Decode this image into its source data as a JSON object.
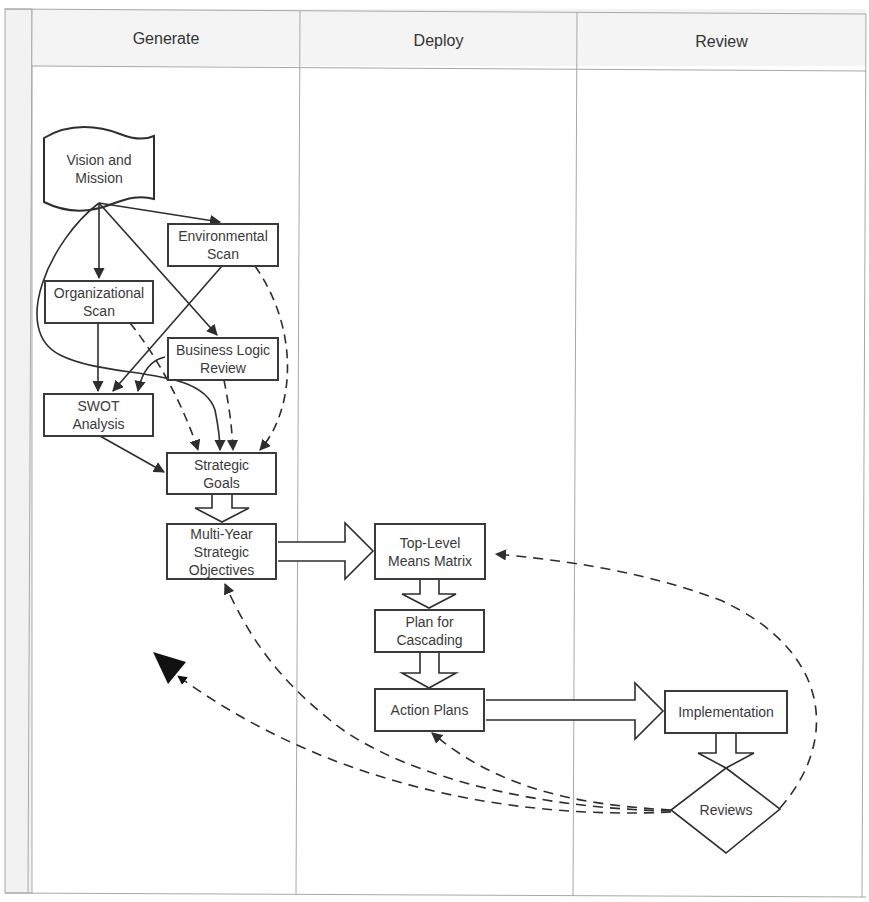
{
  "diagram": {
    "type": "swimlane-flowchart",
    "lanes": [
      {
        "id": "generate",
        "label": "Generate"
      },
      {
        "id": "deploy",
        "label": "Deploy"
      },
      {
        "id": "review",
        "label": "Review"
      }
    ],
    "nodes": {
      "vision": {
        "label": "Vision and\nMission",
        "shape": "document",
        "lane": "generate"
      },
      "env_scan": {
        "label": "Environmental\nScan",
        "shape": "rectangle",
        "lane": "generate"
      },
      "org_scan": {
        "label": "Organizational\nScan",
        "shape": "rectangle",
        "lane": "generate"
      },
      "blr": {
        "label": "Business Logic\nReview",
        "shape": "rectangle",
        "lane": "generate"
      },
      "swot": {
        "label": "SWOT\nAnalysis",
        "shape": "rectangle",
        "lane": "generate"
      },
      "goals": {
        "label": "Strategic\nGoals",
        "shape": "rectangle",
        "lane": "generate"
      },
      "multiyear": {
        "label": "Multi-Year\nStrategic\nObjectives",
        "shape": "rectangle",
        "lane": "generate"
      },
      "toplevel": {
        "label": "Top-Level\nMeans Matrix",
        "shape": "rectangle",
        "lane": "deploy"
      },
      "cascading": {
        "label": "Plan for\nCascading",
        "shape": "rectangle",
        "lane": "deploy"
      },
      "action": {
        "label": "Action Plans",
        "shape": "rectangle",
        "lane": "deploy"
      },
      "impl": {
        "label": "Implementation",
        "shape": "rectangle",
        "lane": "review"
      },
      "reviews": {
        "label": "Reviews",
        "shape": "diamond",
        "lane": "review"
      }
    },
    "edges": [
      {
        "from": "vision",
        "to": "org_scan",
        "style": "solid"
      },
      {
        "from": "vision",
        "to": "env_scan",
        "style": "solid"
      },
      {
        "from": "vision",
        "to": "blr",
        "style": "solid"
      },
      {
        "from": "vision",
        "to": "goals",
        "style": "solid-curved"
      },
      {
        "from": "org_scan",
        "to": "swot",
        "style": "solid"
      },
      {
        "from": "env_scan",
        "to": "swot",
        "style": "solid"
      },
      {
        "from": "blr",
        "to": "swot",
        "style": "solid-curved"
      },
      {
        "from": "swot",
        "to": "goals",
        "style": "solid"
      },
      {
        "from": "org_scan",
        "to": "goals",
        "style": "dashed"
      },
      {
        "from": "blr",
        "to": "goals",
        "style": "dashed"
      },
      {
        "from": "env_scan",
        "to": "goals",
        "style": "dashed"
      },
      {
        "from": "goals",
        "to": "multiyear",
        "style": "block-arrow"
      },
      {
        "from": "multiyear",
        "to": "toplevel",
        "style": "block-arrow"
      },
      {
        "from": "toplevel",
        "to": "cascading",
        "style": "block-arrow"
      },
      {
        "from": "cascading",
        "to": "action",
        "style": "block-arrow"
      },
      {
        "from": "action",
        "to": "impl",
        "style": "block-arrow"
      },
      {
        "from": "impl",
        "to": "reviews",
        "style": "block-arrow"
      },
      {
        "from": "reviews",
        "to": "toplevel",
        "style": "dashed"
      },
      {
        "from": "reviews",
        "to": "action",
        "style": "dashed"
      },
      {
        "from": "reviews",
        "to": "multiyear",
        "style": "dashed"
      },
      {
        "from": "reviews",
        "to": "vision",
        "style": "dashed-large-head"
      }
    ]
  },
  "colors": {
    "stroke": "#3a3a3a",
    "grid": "#a8a8a8",
    "header_bg": "#f4f4f4",
    "left_strip_bg": "#f2f2f2"
  }
}
